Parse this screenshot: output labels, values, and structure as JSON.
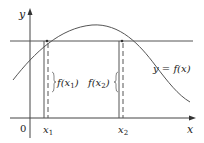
{
  "diagram": {
    "axis_labels": {
      "y": "y",
      "x": "x",
      "origin": "0"
    },
    "tick_labels": {
      "x1": "x",
      "x1_sub": "1",
      "x2": "x",
      "x2_sub": "2"
    },
    "brace_labels": {
      "f1_prefix": "f(x",
      "f1_sub": "1",
      "f1_suffix": ")",
      "f2_prefix": "f(x",
      "f2_sub": "2",
      "f2_suffix": ")"
    },
    "curve_label": "y = f(x)",
    "colors": {
      "line": "#555555",
      "text": "#222222",
      "background": "#ffffff"
    }
  }
}
